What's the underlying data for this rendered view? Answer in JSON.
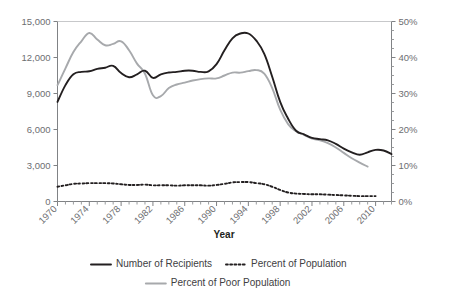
{
  "chart_data": {
    "type": "line",
    "title": "",
    "xlabel": "Year",
    "ylabel": "",
    "y2label": "",
    "xlim": [
      1970,
      2012
    ],
    "ylim": [
      0,
      15000
    ],
    "y2lim": [
      0,
      50
    ],
    "grid": false,
    "legend_position": "bottom",
    "x_tick_labels": [
      "1970",
      "1974",
      "1978",
      "1982",
      "1986",
      "1990",
      "1994",
      "1998",
      "2002",
      "2006",
      "2010"
    ],
    "x_tick_values": [
      1970,
      1974,
      1978,
      1982,
      1986,
      1990,
      1994,
      1998,
      2002,
      2006,
      2010
    ],
    "x_minor_tick_step": 1,
    "y_tick_labels": [
      "0",
      "3,000",
      "6,000",
      "9,000",
      "12,000",
      "15,000"
    ],
    "y_tick_values": [
      0,
      3000,
      6000,
      9000,
      12000,
      15000
    ],
    "y2_tick_labels": [
      "0%",
      "10%",
      "20%",
      "30%",
      "40%",
      "50%"
    ],
    "y2_tick_values": [
      0,
      10,
      20,
      30,
      40,
      50
    ],
    "y2_minor_tick_step": 2.5,
    "series": [
      {
        "name": "Number of Recipients",
        "axis": "left",
        "style": "solid",
        "color": "#231f20",
        "width": 1.9,
        "x": [
          1970,
          1971,
          1972,
          1973,
          1974,
          1975,
          1976,
          1977,
          1978,
          1979,
          1980,
          1981,
          1982,
          1983,
          1984,
          1985,
          1986,
          1987,
          1988,
          1989,
          1990,
          1991,
          1992,
          1993,
          1994,
          1995,
          1996,
          1997,
          1998,
          1999,
          2000,
          2001,
          2002,
          2003,
          2004,
          2005,
          2006,
          2007,
          2008,
          2009,
          2010,
          2011,
          2012
        ],
        "y": [
          8300,
          9700,
          10600,
          10800,
          10850,
          11050,
          11150,
          11300,
          10700,
          10350,
          10600,
          10900,
          10300,
          10600,
          10750,
          10800,
          10900,
          10900,
          10800,
          10850,
          11450,
          12600,
          13600,
          14000,
          14000,
          13400,
          12300,
          10400,
          8300,
          6900,
          5900,
          5600,
          5300,
          5200,
          5100,
          4800,
          4400,
          4100,
          3900,
          4100,
          4300,
          4250,
          3950
        ]
      },
      {
        "name": "Percent of Poor Population",
        "axis": "right",
        "style": "solid",
        "color": "#a7a9ac",
        "width": 1.9,
        "x": [
          1970,
          1971,
          1972,
          1973,
          1974,
          1975,
          1976,
          1977,
          1978,
          1979,
          1980,
          1981,
          1982,
          1983,
          1984,
          1985,
          1986,
          1987,
          1988,
          1989,
          1990,
          1991,
          1992,
          1993,
          1994,
          1995,
          1996,
          1997,
          1998,
          1999,
          2000,
          2001,
          2002,
          2003,
          2004,
          2005,
          2006,
          2007,
          2008,
          2009
        ],
        "y": [
          32.3,
          37.0,
          41.5,
          44.5,
          46.8,
          45.0,
          43.4,
          43.8,
          44.5,
          42.0,
          38.3,
          35.5,
          29.5,
          29.3,
          31.5,
          32.5,
          33.0,
          33.6,
          34.0,
          34.2,
          34.2,
          35.0,
          35.8,
          35.8,
          36.2,
          36.5,
          35.5,
          31.5,
          25.5,
          21.5,
          19.5,
          18.5,
          17.5,
          17.0,
          16.2,
          15.0,
          13.5,
          12.0,
          10.8,
          9.7
        ]
      },
      {
        "name": "Percent of Population",
        "axis": "right",
        "style": "dotted",
        "color": "#231f20",
        "width": 1.9,
        "x": [
          1970,
          1971,
          1972,
          1973,
          1974,
          1975,
          1976,
          1977,
          1978,
          1979,
          1980,
          1981,
          1982,
          1983,
          1984,
          1985,
          1986,
          1987,
          1988,
          1989,
          1990,
          1991,
          1992,
          1993,
          1994,
          1995,
          1996,
          1997,
          1998,
          1999,
          2000,
          2001,
          2002,
          2003,
          2004,
          2005,
          2006,
          2007,
          2008,
          2009,
          2010
        ],
        "y": [
          4.1,
          4.5,
          4.9,
          5.0,
          5.1,
          5.1,
          5.1,
          5.0,
          4.8,
          4.6,
          4.6,
          4.7,
          4.5,
          4.5,
          4.5,
          4.4,
          4.5,
          4.5,
          4.5,
          4.4,
          4.6,
          4.9,
          5.3,
          5.4,
          5.4,
          5.1,
          4.8,
          4.1,
          3.2,
          2.5,
          2.2,
          2.1,
          2.0,
          2.0,
          1.9,
          1.8,
          1.7,
          1.6,
          1.5,
          1.5,
          1.5
        ]
      }
    ],
    "legend": [
      {
        "label": "Number of Recipients",
        "style": "solid",
        "color": "#231f20",
        "row": 0
      },
      {
        "label": "Percent of Population",
        "style": "dotted",
        "color": "#231f20",
        "row": 0
      },
      {
        "label": "Percent of Poor Population",
        "style": "solid",
        "color": "#a7a9ac",
        "row": 1
      }
    ]
  },
  "colors": {
    "recipients": "#231f20",
    "percent_population": "#231f20",
    "percent_poor_population": "#a7a9ac",
    "axis": "#808285",
    "tick_text": "#6d6e71",
    "background": "#ffffff"
  }
}
